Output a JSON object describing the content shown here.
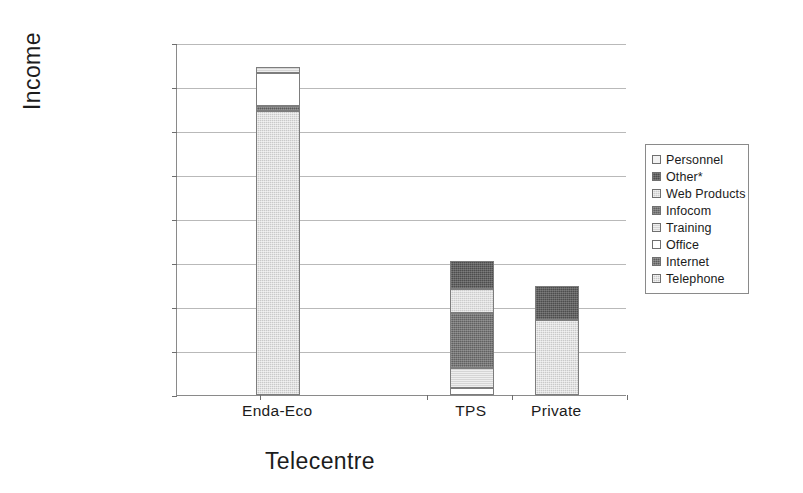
{
  "chart_data": {
    "type": "bar",
    "subtype": "stacked-column",
    "title": "",
    "xlabel": "Telecentre",
    "ylabel": "Income",
    "categories": [
      "Enda-Eco",
      "TPS",
      "Private"
    ],
    "ylim": [
      0,
      1600000
    ],
    "ytick_step": 200000,
    "ytick_labels": [
      "1600000",
      "1400000",
      "1200000",
      "1000000",
      "800000",
      "600000",
      "400000",
      "200000",
      "0"
    ],
    "ytick_values": [
      1600000,
      1400000,
      1200000,
      1000000,
      800000,
      600000,
      400000,
      200000,
      0
    ],
    "grid": true,
    "grid_axis": "y",
    "legend_position": "right",
    "legend_order_top_to_bottom": [
      "Personnel",
      "Other*",
      "Web Products",
      "Infocom",
      "Training",
      "Office",
      "Internet",
      "Telephone"
    ],
    "series": [
      {
        "name": "Telephone",
        "color": "#c9c9c9",
        "values": [
          1290000,
          0,
          340000
        ]
      },
      {
        "name": "Internet",
        "color": "#5c5c5c",
        "values": [
          25000,
          0,
          0
        ]
      },
      {
        "name": "Office",
        "color": "#ffffff",
        "values": [
          150000,
          30000,
          0
        ]
      },
      {
        "name": "Training",
        "color": "#d5d5d5",
        "values": [
          25000,
          95000,
          0
        ]
      },
      {
        "name": "Infocom",
        "color": "#616161",
        "values": [
          0,
          250000,
          0
        ]
      },
      {
        "name": "Web Products",
        "color": "#cccccc",
        "values": [
          0,
          105000,
          0
        ]
      },
      {
        "name": "Other*",
        "color": "#4d4d4d",
        "values": [
          0,
          130000,
          157000
        ]
      },
      {
        "name": "Personnel",
        "color": "#f2f2f2",
        "values": [
          0,
          0,
          0
        ]
      }
    ],
    "totals": [
      1490000,
      605000,
      497000
    ]
  },
  "legend": {
    "items": [
      {
        "label": "Personnel",
        "swatch_class": "f-personnel"
      },
      {
        "label": "Other*",
        "swatch_class": "f-other"
      },
      {
        "label": "Web Products",
        "swatch_class": "f-web"
      },
      {
        "label": "Infocom",
        "swatch_class": "f-infocom"
      },
      {
        "label": "Training",
        "swatch_class": "f-training"
      },
      {
        "label": "Office",
        "swatch_class": "f-office"
      },
      {
        "label": "Internet",
        "swatch_class": "f-internet"
      },
      {
        "label": "Telephone",
        "swatch_class": "f-telephone"
      }
    ]
  },
  "axes": {
    "y_title": "Income",
    "x_title": "Telecentre"
  }
}
